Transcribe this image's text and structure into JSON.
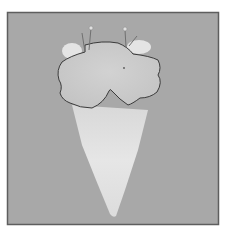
{
  "image": {
    "subject": "pinned-specimen",
    "colors": {
      "background": "#ffffff",
      "frame": "#6a6a6a",
      "field": "#a9a9a9",
      "specimen_light": "#e2e2e2",
      "specimen_mid": "#cfcfcf",
      "outline": "#3a3a3a",
      "pin": "#777777"
    }
  }
}
